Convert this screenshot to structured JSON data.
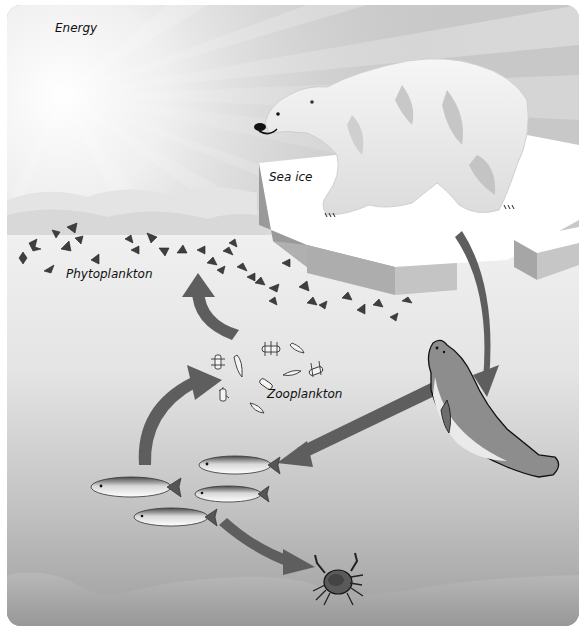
{
  "diagram": {
    "type": "arctic-marine-food-web",
    "labels": {
      "energy": "Energy",
      "sea_ice": "Sea ice",
      "phytoplankton": "Phytoplankton",
      "zooplankton": "Zooplankton"
    },
    "nodes": [
      {
        "id": "sun",
        "name": "Sun (energy source)"
      },
      {
        "id": "polar_bear",
        "name": "Polar bear"
      },
      {
        "id": "sea_ice",
        "name": "Sea ice"
      },
      {
        "id": "phytoplankton",
        "name": "Phytoplankton"
      },
      {
        "id": "zooplankton",
        "name": "Zooplankton"
      },
      {
        "id": "fish",
        "name": "Fish (Arctic char)"
      },
      {
        "id": "seal",
        "name": "Seal"
      },
      {
        "id": "crab",
        "name": "Crab"
      }
    ],
    "arrows": [
      {
        "from": "polar_bear",
        "to": "seal"
      },
      {
        "from": "seal",
        "to": "fish"
      },
      {
        "from": "fish",
        "to": "zooplankton"
      },
      {
        "from": "zooplankton",
        "to": "phytoplankton"
      },
      {
        "from": "fish",
        "to": "crab"
      }
    ],
    "colors": {
      "arrow": "#5e5e5e",
      "ice_top": "#ffffff",
      "ice_side": "#a9a9a9",
      "sky": "#c9c9c9",
      "seafloor": "#a6a6a6"
    }
  }
}
